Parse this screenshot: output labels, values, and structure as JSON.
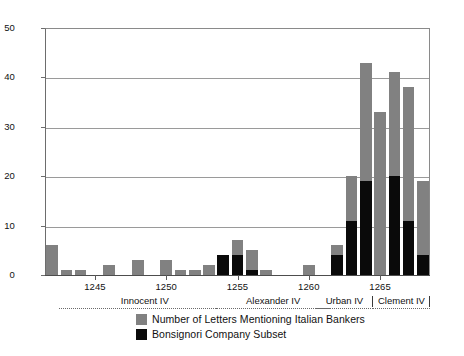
{
  "chart_data": {
    "type": "bar",
    "title": "",
    "subtitle": "",
    "xlabel": "",
    "ylabel": "",
    "grid": true,
    "legend_position": "bottom-center",
    "bar_style": "overlaid",
    "ylim": [
      0,
      50
    ],
    "yticks": [
      0,
      10,
      20,
      30,
      40,
      50
    ],
    "ytick_labels": [
      "0",
      "10",
      "20",
      "30",
      "40",
      "50"
    ],
    "xlim": [
      1241.5,
      1268.5
    ],
    "xticks": [
      1245,
      1250,
      1255,
      1260,
      1265
    ],
    "xtick_labels": [
      "1245",
      "1250",
      "1255",
      "1260",
      "1265"
    ],
    "categories": [
      1242,
      1243,
      1244,
      1245,
      1246,
      1247,
      1248,
      1249,
      1250,
      1251,
      1252,
      1253,
      1254,
      1255,
      1256,
      1257,
      1258,
      1259,
      1260,
      1261,
      1262,
      1263,
      1264,
      1265,
      1266,
      1267,
      1268
    ],
    "series": [
      {
        "name": "Number of Letters Mentioning Italian Bankers",
        "color": "#818181",
        "values": [
          6,
          1,
          1,
          0,
          2,
          0,
          3,
          0,
          3,
          1,
          1,
          2,
          4,
          7,
          5,
          1,
          0,
          0,
          2,
          0,
          6,
          20,
          43,
          33,
          41,
          38,
          19
        ]
      },
      {
        "name": "Bonsignori Company Subset",
        "color": "#0a0a0a",
        "values": [
          0,
          0,
          0,
          0,
          0,
          0,
          0,
          0,
          0,
          0,
          0,
          0,
          4,
          4,
          1,
          0,
          0,
          0,
          0,
          0,
          4,
          11,
          19,
          0,
          20,
          11,
          4
        ]
      }
    ],
    "period_bands": [
      {
        "label": "Innocent IV",
        "start": 1243,
        "end": 1254
      },
      {
        "label": "Alexander IV",
        "start": 1254,
        "end": 1261
      },
      {
        "label": "Urban IV",
        "start": 1261,
        "end": 1264
      },
      {
        "label": "Clement IV",
        "start": 1265,
        "end": 1268
      }
    ]
  },
  "legend": {
    "items": [
      {
        "label": "Number of Letters Mentioning Italian Bankers",
        "color": "#818181"
      },
      {
        "label": "Bonsignori Company Subset",
        "color": "#0a0a0a"
      }
    ]
  }
}
